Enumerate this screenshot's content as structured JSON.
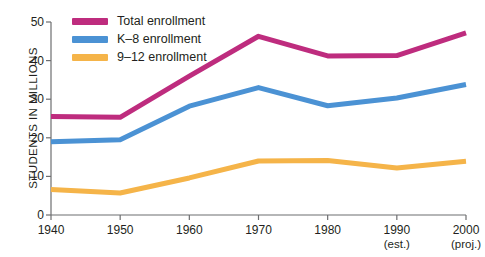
{
  "chart_data": {
    "type": "line",
    "title": "",
    "xlabel": "",
    "ylabel": "STUDENTS IN MILLIONS",
    "x": [
      1940,
      1950,
      1960,
      1970,
      1980,
      1990,
      2000
    ],
    "categories": [
      "1940",
      "1950",
      "1960",
      "1970",
      "1980",
      "1990",
      "2000"
    ],
    "xtick_notes": [
      "",
      "",
      "",
      "",
      "",
      "(est.)",
      "(proj.)"
    ],
    "xlim": [
      1940,
      2000
    ],
    "ylim": [
      0,
      50
    ],
    "yticks": [
      0,
      10,
      20,
      30,
      40,
      50
    ],
    "grid": false,
    "legend_position": "top-left",
    "series": [
      {
        "name": "Total enrollment",
        "color": "#BE2C7E",
        "values": [
          25.5,
          25.3,
          36.0,
          46.3,
          41.2,
          41.3,
          47.2
        ]
      },
      {
        "name": "K–8 enrollment",
        "color": "#4B92D4",
        "values": [
          19.0,
          19.5,
          28.2,
          33.0,
          28.3,
          30.3,
          33.8
        ]
      },
      {
        "name": "9–12 enrollment",
        "color": "#F5B449",
        "values": [
          6.6,
          5.7,
          9.6,
          14.0,
          14.1,
          12.2,
          13.9
        ]
      }
    ]
  },
  "axis": {
    "y_title": "STUDENTS IN MILLIONS",
    "y_labels": [
      "50",
      "40",
      "30",
      "20",
      "10",
      "0"
    ],
    "x_labels": [
      "1940",
      "1950",
      "1960",
      "1970",
      "1980",
      "1990",
      "2000"
    ],
    "x_notes": [
      "",
      "",
      "",
      "",
      "",
      "(est.)",
      "(proj.)"
    ]
  },
  "legend": {
    "items": [
      {
        "label": "Total enrollment",
        "color": "#BE2C7E"
      },
      {
        "label": "K–8 enrollment",
        "color": "#4B92D4"
      },
      {
        "label": "9–12 enrollment",
        "color": "#F5B449"
      }
    ]
  },
  "colors": {
    "axis": "#6d6e70",
    "text": "#231f20",
    "background": "#ffffff"
  }
}
